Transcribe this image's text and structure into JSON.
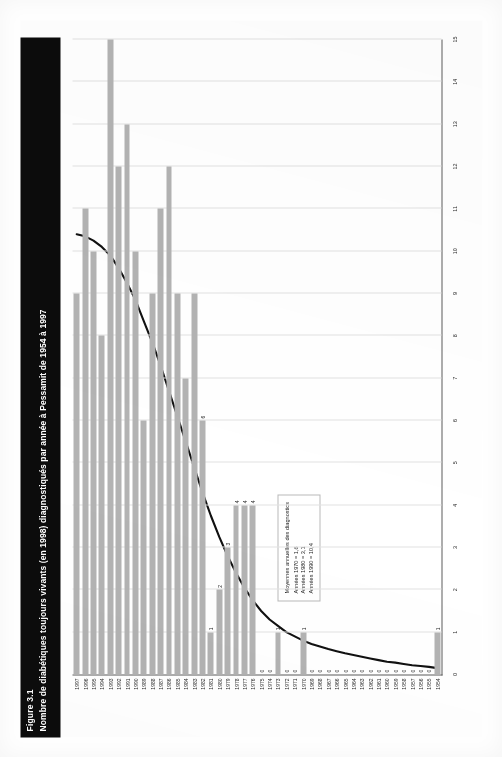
{
  "document": {
    "figure_number": "Figure 3.1",
    "title": "Nombre de diabétiques toujours vivants (en 1998) diagnostiqués par année à Pessamit de 1954 à 1997"
  },
  "legend": {
    "title": "Moyennes annuelles des diagnostics",
    "lines": [
      "Années 1970 = 1,6",
      "Années 1980 = 3,1",
      "Années 1990 = 10,4"
    ]
  },
  "colors": {
    "bar": "#b3b3b3",
    "trend_line": "#111111",
    "title_bar": "#0c0c0c",
    "grid": "#e2e2e2",
    "axis": "#5d5d5d"
  },
  "chart_data": {
    "type": "bar",
    "orientation": "horizontal",
    "title": "Nombre de diabétiques toujours vivants (en 1998) diagnostiqués par année à Pessamit de 1954 à 1997",
    "xlabel": "",
    "ylabel": "",
    "grid": true,
    "legend_position": "inside-left",
    "ylim": [
      0,
      15
    ],
    "value_axis_ticks": [
      0,
      1,
      2,
      3,
      4,
      5,
      6,
      7,
      8,
      9,
      10,
      11,
      12,
      13,
      14,
      15
    ],
    "categories": [
      "1954",
      "1955",
      "1956",
      "1957",
      "1958",
      "1959",
      "1960",
      "1961",
      "1962",
      "1963",
      "1964",
      "1965",
      "1966",
      "1967",
      "1968",
      "1969",
      "1970",
      "1971",
      "1972",
      "1973",
      "1974",
      "1975",
      "1976",
      "1977",
      "1978",
      "1979",
      "1980",
      "1981",
      "1982",
      "1983",
      "1984",
      "1985",
      "1986",
      "1987",
      "1988",
      "1989",
      "1990",
      "1991",
      "1992",
      "1993",
      "1994",
      "1995",
      "1996",
      "1997"
    ],
    "values": [
      1,
      0,
      0,
      0,
      0,
      0,
      0,
      0,
      0,
      0,
      0,
      0,
      0,
      0,
      0,
      0,
      1,
      0,
      0,
      1,
      0,
      0,
      4,
      4,
      4,
      3,
      2,
      1,
      6,
      9,
      7,
      9,
      12,
      11,
      9,
      6,
      10,
      13,
      12,
      15,
      8,
      10,
      11,
      9
    ],
    "series": [
      {
        "name": "Nombre de diabétiques diagnostiqués",
        "values": [
          1,
          0,
          0,
          0,
          0,
          0,
          0,
          0,
          0,
          0,
          0,
          0,
          0,
          0,
          0,
          0,
          1,
          0,
          0,
          1,
          0,
          0,
          4,
          4,
          4,
          3,
          2,
          1,
          6,
          9,
          7,
          9,
          12,
          11,
          9,
          6,
          10,
          13,
          12,
          15,
          8,
          10,
          11,
          9
        ]
      },
      {
        "name": "Courbe de tendance cumulative",
        "type": "line",
        "values": [
          0.15,
          0.18,
          0.2,
          0.22,
          0.25,
          0.28,
          0.3,
          0.34,
          0.38,
          0.42,
          0.46,
          0.5,
          0.55,
          0.6,
          0.66,
          0.72,
          0.8,
          0.9,
          1.0,
          1.15,
          1.3,
          1.5,
          1.75,
          2.05,
          2.4,
          2.8,
          3.25,
          3.75,
          4.3,
          4.9,
          5.5,
          6.1,
          6.7,
          7.3,
          7.85,
          8.35,
          8.85,
          9.25,
          9.6,
          9.9,
          10.1,
          10.25,
          10.35,
          10.4
        ]
      }
    ],
    "data_labels_shown": [
      {
        "category": "1954",
        "value": 1
      },
      {
        "category": "1955",
        "value": 0
      },
      {
        "category": "1956",
        "value": 0
      },
      {
        "category": "1957",
        "value": 0
      },
      {
        "category": "1958",
        "value": 0
      },
      {
        "category": "1959",
        "value": 0
      },
      {
        "category": "1960",
        "value": 0
      },
      {
        "category": "1961",
        "value": 0
      },
      {
        "category": "1962",
        "value": 0
      },
      {
        "category": "1963",
        "value": 0
      },
      {
        "category": "1964",
        "value": 0
      },
      {
        "category": "1965",
        "value": 0
      },
      {
        "category": "1966",
        "value": 0
      },
      {
        "category": "1967",
        "value": 0
      },
      {
        "category": "1968",
        "value": 0
      },
      {
        "category": "1969",
        "value": 0
      },
      {
        "category": "1970",
        "value": 1
      },
      {
        "category": "1971",
        "value": 0
      },
      {
        "category": "1972",
        "value": 0
      },
      {
        "category": "1973",
        "value": 1
      },
      {
        "category": "1974",
        "value": 0
      },
      {
        "category": "1975",
        "value": 0
      },
      {
        "category": "1976",
        "value": 4
      },
      {
        "category": "1977",
        "value": 4
      },
      {
        "category": "1978",
        "value": 4
      },
      {
        "category": "1979",
        "value": 3
      },
      {
        "category": "1980",
        "value": 2
      },
      {
        "category": "1981",
        "value": 1
      },
      {
        "category": "1982",
        "value": 6
      }
    ]
  }
}
